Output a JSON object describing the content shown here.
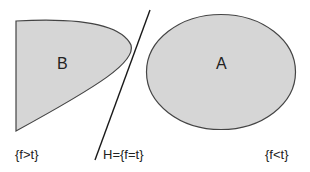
{
  "diagram": {
    "type": "set-separation",
    "colors": {
      "fill": "#d6d6d6",
      "stroke": "#444444",
      "line": "#1a1a1a",
      "text": "#222222"
    },
    "regions": [
      {
        "id": "B",
        "label": "B",
        "shape": "parabolic-region"
      },
      {
        "id": "A",
        "label": "A",
        "shape": "ellipse"
      }
    ],
    "hyperplane": {
      "label": "H={f=t}"
    },
    "halfspaces": [
      {
        "label": "{f>t}",
        "side": "left"
      },
      {
        "label": "{f<t}",
        "side": "right"
      }
    ]
  }
}
